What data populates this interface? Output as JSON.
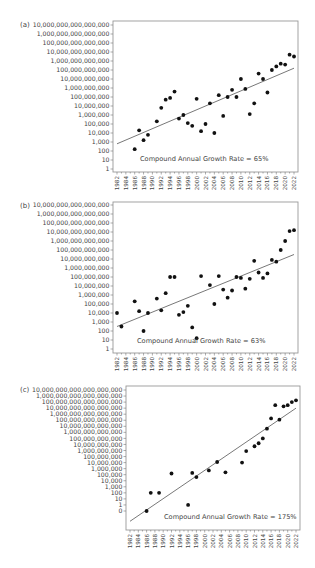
{
  "panels": [
    {
      "label": "(a)"
    },
    {
      "label": "(b)"
    },
    {
      "label": "(c)"
    }
  ],
  "chart_data": [
    {
      "type": "scatter",
      "panel": "(a)",
      "title": "",
      "xlabel": "",
      "ylabel": "",
      "y_scale": "log",
      "annotation": "Compound Annual Growth Rate = 65%",
      "x_ticks": [
        "1982",
        "1984",
        "1986",
        "1988",
        "1990",
        "1992",
        "1994",
        "1996",
        "1998",
        "2000",
        "2002",
        "2004",
        "2006",
        "2008",
        "2010",
        "2012",
        "2014",
        "2016",
        "2018",
        "2020",
        "2022"
      ],
      "y_ticks": [
        "10,000,000,000,000,000",
        "1,000,000,000,000,000",
        "100,000,000,000,000",
        "10,000,000,000,000",
        "1,000,000,000,000",
        "100,000,000,000",
        "10,000,000,000",
        "1,000,000,000",
        "100,000,000",
        "10,000,000",
        "1,000,000",
        "100,000",
        "10,000",
        "1,000",
        "100",
        "10",
        "1"
      ],
      "xlim": [
        1982,
        2022
      ],
      "ylim_log10": [
        0,
        16
      ],
      "grid": false,
      "points_log10": [
        [
          1986,
          2.2
        ],
        [
          1987,
          4.3
        ],
        [
          1988,
          3.2
        ],
        [
          1989,
          3.8
        ],
        [
          1991,
          5.3
        ],
        [
          1992,
          6.8
        ],
        [
          1993,
          7.7
        ],
        [
          1994,
          7.9
        ],
        [
          1995,
          8.6
        ],
        [
          1996,
          5.6
        ],
        [
          1997,
          6.0
        ],
        [
          1998,
          5.1
        ],
        [
          1999,
          4.8
        ],
        [
          2000,
          7.8
        ],
        [
          2001,
          4.2
        ],
        [
          2002,
          5.0
        ],
        [
          2003,
          7.3
        ],
        [
          2004,
          4.0
        ],
        [
          2005,
          8.2
        ],
        [
          2006,
          5.9
        ],
        [
          2007,
          8.0
        ],
        [
          2008,
          8.8
        ],
        [
          2009,
          8.0
        ],
        [
          2010,
          10.0
        ],
        [
          2011,
          8.9
        ],
        [
          2012,
          6.1
        ],
        [
          2013,
          7.3
        ],
        [
          2014,
          10.6
        ],
        [
          2015,
          10.0
        ],
        [
          2016,
          8.5
        ],
        [
          2017,
          11.0
        ],
        [
          2018,
          11.4
        ],
        [
          2019,
          11.7
        ],
        [
          2020,
          11.6
        ],
        [
          2021,
          12.7
        ],
        [
          2022,
          12.5
        ]
      ],
      "trendline_log10": [
        [
          1982,
          2.8
        ],
        [
          2022,
          11.2
        ]
      ]
    },
    {
      "type": "scatter",
      "panel": "(b)",
      "title": "",
      "xlabel": "",
      "ylabel": "",
      "y_scale": "log",
      "annotation": "Compound Annual Growth Rate = 63%",
      "x_ticks": [
        "1982",
        "1984",
        "1986",
        "1988",
        "1990",
        "1992",
        "1994",
        "1996",
        "1998",
        "2000",
        "2002",
        "2004",
        "2006",
        "2008",
        "2010",
        "2012",
        "2014",
        "2016",
        "2018",
        "2020",
        "2022"
      ],
      "y_ticks": [
        "10,000,000,000,000,000",
        "1,000,000,000,000,000",
        "100,000,000,000,000",
        "10,000,000,000,000",
        "1,000,000,000,000",
        "100,000,000,000",
        "10,000,000,000",
        "1,000,000,000",
        "100,000,000",
        "10,000,000",
        "1,000,000",
        "100,000",
        "10,000",
        "1,000",
        "100",
        "10",
        "1"
      ],
      "xlim": [
        1982,
        2022
      ],
      "ylim_log10": [
        0,
        16
      ],
      "grid": false,
      "points_log10": [
        [
          1982,
          4.0
        ],
        [
          1983,
          2.5
        ],
        [
          1986,
          5.3
        ],
        [
          1987,
          4.2
        ],
        [
          1988,
          2.0
        ],
        [
          1989,
          4.0
        ],
        [
          1991,
          5.6
        ],
        [
          1992,
          4.3
        ],
        [
          1993,
          6.2
        ],
        [
          1994,
          8.0
        ],
        [
          1995,
          8.0
        ],
        [
          1996,
          3.8
        ],
        [
          1997,
          4.1
        ],
        [
          1998,
          4.8
        ],
        [
          1999,
          2.4
        ],
        [
          2000,
          1.2
        ],
        [
          2001,
          8.1
        ],
        [
          2003,
          7.1
        ],
        [
          2004,
          5.0
        ],
        [
          2005,
          8.1
        ],
        [
          2006,
          6.6
        ],
        [
          2007,
          5.7
        ],
        [
          2008,
          6.5
        ],
        [
          2009,
          8.0
        ],
        [
          2010,
          7.9
        ],
        [
          2011,
          6.7
        ],
        [
          2012,
          7.8
        ],
        [
          2013,
          9.8
        ],
        [
          2014,
          8.5
        ],
        [
          2015,
          7.9
        ],
        [
          2016,
          8.4
        ],
        [
          2017,
          9.9
        ],
        [
          2018,
          9.7
        ],
        [
          2019,
          11.0
        ],
        [
          2020,
          12.0
        ],
        [
          2021,
          13.1
        ],
        [
          2022,
          13.2
        ]
      ],
      "trendline_log10": [
        [
          1982,
          2.5
        ],
        [
          2022,
          10.5
        ]
      ]
    },
    {
      "type": "scatter",
      "panel": "(c)",
      "title": "",
      "xlabel": "",
      "ylabel": "",
      "y_scale": "log",
      "annotation": "Compound Annual Growth Rate = 175%",
      "x_ticks": [
        "1982",
        "1984",
        "1986",
        "1988",
        "1990",
        "1992",
        "1994",
        "1996",
        "1998",
        "2000",
        "2002",
        "2004",
        "2006",
        "2008",
        "2010",
        "2012",
        "2014",
        "2016",
        "2018",
        "2020",
        "2022"
      ],
      "y_ticks": [
        "10,000,000,000,000,000,000",
        "1,000,000,000,000,000,000",
        "100,000,000,000,000,000",
        "10,000,000,000,000,000",
        "1,000,000,000,000,000",
        "100,000,000,000,000",
        "10,000,000,000,000",
        "1,000,000,000,000",
        "100,000,000,000",
        "10,000,000,000",
        "1,000,000,000",
        "100,000,000",
        "10,000,000",
        "1,000,000",
        "100,000",
        "10,000",
        "1,000",
        "100",
        "10",
        "1",
        "0"
      ],
      "xlim": [
        1982,
        2022
      ],
      "ylim_index": [
        -1,
        19
      ],
      "grid": false,
      "points_log10": [
        [
          1986,
          -1.0
        ],
        [
          1987,
          2.0
        ],
        [
          1989,
          2.0
        ],
        [
          1992,
          5.2
        ],
        [
          1996,
          0.0
        ],
        [
          1997,
          5.3
        ],
        [
          1998,
          4.6
        ],
        [
          2001,
          5.7
        ],
        [
          2003,
          7.1
        ],
        [
          2005,
          5.4
        ],
        [
          2009,
          7.0
        ],
        [
          2010,
          8.9
        ],
        [
          2012,
          9.7
        ],
        [
          2013,
          10.2
        ],
        [
          2014,
          11.0
        ],
        [
          2015,
          12.6
        ],
        [
          2016,
          14.3
        ],
        [
          2017,
          16.5
        ],
        [
          2018,
          14.1
        ],
        [
          2019,
          16.3
        ],
        [
          2020,
          16.5
        ],
        [
          2021,
          17.0
        ],
        [
          2022,
          17.3
        ]
      ],
      "trendline_log10": [
        [
          1982,
          -2.7
        ],
        [
          2022,
          16.0
        ]
      ]
    }
  ]
}
